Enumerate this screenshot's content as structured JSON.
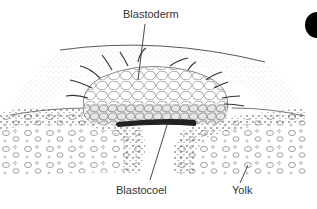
{
  "diagram": {
    "title": "",
    "labels": {
      "blastoderm": "Blastoderm",
      "blastocoel": "Blastocoel",
      "yolk": "Yolk"
    },
    "colors": {
      "line": "#333333",
      "cell_outline": "#555555",
      "stipple": "#999999",
      "blastocoel_fill": "#222222",
      "corner_marker": "#000000"
    }
  }
}
